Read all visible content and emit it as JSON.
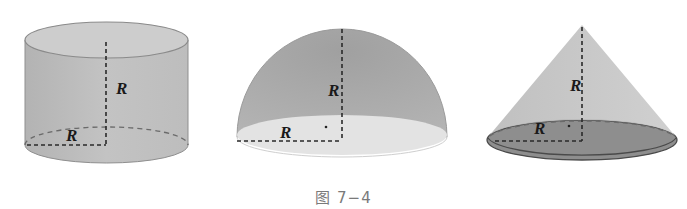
{
  "figure": {
    "caption": "图 7−4",
    "solids": [
      {
        "name": "cylinder",
        "labels": {
          "height": "R",
          "radius": "R"
        },
        "colors": {
          "side": "#b9b9b9",
          "top": "#cfcfcf",
          "edge": "#8a8a8a"
        }
      },
      {
        "name": "hemisphere",
        "labels": {
          "height": "R",
          "radius": "R"
        },
        "colors": {
          "dome": "#a9a9a9",
          "base": "#e4e4e4",
          "edge": "#9a9a9a"
        }
      },
      {
        "name": "cone",
        "labels": {
          "height": "R",
          "radius": "R"
        },
        "colors": {
          "side": "#c2c2c2",
          "base": "#8e8e8e",
          "edge": "#555555"
        }
      }
    ]
  }
}
